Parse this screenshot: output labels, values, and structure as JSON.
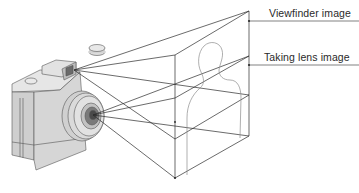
{
  "diagram": {
    "labels": {
      "viewfinder": "Viewfinder image",
      "taking_lens": "Taking lens image"
    },
    "colors": {
      "line": "#2b2b2b",
      "camera_body": "#d9d9d9",
      "camera_dark": "#8a8a8a",
      "silhouette": "#8c8c8c"
    }
  }
}
